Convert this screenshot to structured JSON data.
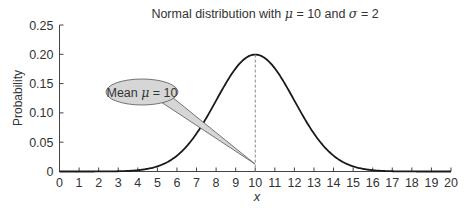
{
  "chart_data": {
    "type": "line",
    "title": "Normal distribution with μ = 10 and σ = 2",
    "title_parts": {
      "prefix": "Normal distribution with ",
      "mu": "μ",
      "mid": " = 10 and ",
      "sigma": "σ",
      "suffix": " = 2"
    },
    "xlabel": "x",
    "ylabel": "Probability",
    "xlim": [
      0,
      20
    ],
    "ylim": [
      0,
      0.25
    ],
    "x_ticks": [
      "0",
      "1",
      "2",
      "3",
      "4",
      "5",
      "6",
      "7",
      "8",
      "9",
      "10",
      "11",
      "12",
      "13",
      "14",
      "15",
      "16",
      "17",
      "18",
      "19",
      "20"
    ],
    "y_ticks": [
      "0",
      "0.05",
      "0.10",
      "0.15",
      "0.20",
      "0.25"
    ],
    "y_tick_values": [
      0,
      0.05,
      0.1,
      0.15,
      0.2,
      0.25
    ],
    "grid": false,
    "legend": null,
    "series": [
      {
        "name": "Normal pdf",
        "mean": 10,
        "sd": 2,
        "x": [
          0,
          1,
          2,
          3,
          4,
          5,
          6,
          7,
          8,
          9,
          10,
          11,
          12,
          13,
          14,
          15,
          16,
          17,
          18,
          19,
          20
        ],
        "values": [
          0.0,
          0.0,
          0.0001,
          0.0004,
          0.0022,
          0.0088,
          0.027,
          0.0648,
          0.121,
          0.176,
          0.1995,
          0.176,
          0.121,
          0.0648,
          0.027,
          0.0088,
          0.0022,
          0.0004,
          0.0001,
          0.0,
          0.0
        ]
      }
    ],
    "annotations": [
      {
        "type": "callout",
        "text": "Mean μ = 10",
        "text_parts": {
          "prefix": "Mean ",
          "mu": "μ",
          "suffix": " = 10"
        },
        "points_to": [
          10,
          0.01
        ]
      },
      {
        "type": "vertical-dashed-line",
        "x": 10,
        "y_to": 0.1995
      }
    ]
  }
}
